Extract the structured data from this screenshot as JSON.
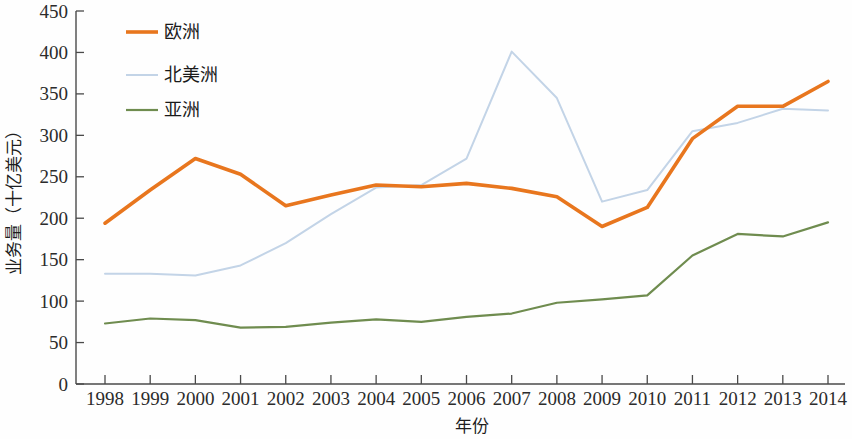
{
  "chart_data": {
    "type": "line",
    "title": "",
    "xlabel": "年份",
    "ylabel": "业务量（十亿美元）",
    "xlim": [
      1998,
      2014
    ],
    "ylim": [
      0,
      450
    ],
    "y_ticks": [
      0,
      50,
      100,
      150,
      200,
      250,
      300,
      350,
      400,
      450
    ],
    "grid": false,
    "legend_position": "top-left",
    "categories": [
      "1998",
      "1999",
      "2000",
      "2001",
      "2002",
      "2003",
      "2004",
      "2005",
      "2006",
      "2007",
      "2008",
      "2009",
      "2010",
      "2011",
      "2012",
      "2013",
      "2014"
    ],
    "series": [
      {
        "name": "欧洲",
        "color": "#E8761E",
        "width": 3.6,
        "values": [
          194,
          234,
          272,
          253,
          215,
          228,
          240,
          238,
          242,
          236,
          226,
          190,
          213,
          296,
          335,
          335,
          365
        ]
      },
      {
        "name": "北美洲",
        "color": "#C3D4E7",
        "width": 2.0,
        "values": [
          133,
          133,
          131,
          143,
          170,
          205,
          237,
          240,
          272,
          401,
          345,
          220,
          234,
          305,
          315,
          332,
          330
        ]
      },
      {
        "name": "亚洲",
        "color": "#6F8C4F",
        "width": 2.2,
        "values": [
          73,
          79,
          77,
          68,
          69,
          74,
          78,
          75,
          81,
          85,
          98,
          102,
          107,
          155,
          181,
          178,
          195
        ]
      }
    ]
  },
  "axes": {
    "y_tick_labels": [
      "0",
      "50",
      "100",
      "150",
      "200",
      "250",
      "300",
      "350",
      "400",
      "450"
    ],
    "x_tick_labels": [
      "1998",
      "1999",
      "2000",
      "2001",
      "2002",
      "2003",
      "2004",
      "2005",
      "2006",
      "2007",
      "2008",
      "2009",
      "2010",
      "2011",
      "2012",
      "2013",
      "2014"
    ],
    "x_title": "年份",
    "y_title": "业务量（十亿美元）"
  },
  "legend": {
    "items": [
      {
        "label": "欧洲",
        "color": "#E8761E"
      },
      {
        "label": "北美洲",
        "color": "#C3D4E7"
      },
      {
        "label": "亚洲",
        "color": "#6F8C4F"
      }
    ]
  }
}
